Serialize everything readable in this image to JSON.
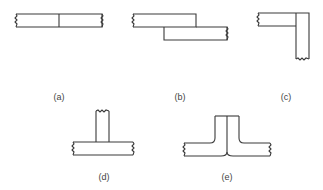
{
  "figure": {
    "panels": [
      {
        "id": "a",
        "label": "(a)",
        "description": "butt joint: two plates end to end"
      },
      {
        "id": "b",
        "label": "(b)",
        "description": "lap joint: two overlapping plates"
      },
      {
        "id": "c",
        "label": "(c)",
        "description": "corner joint: plates meeting at right angle"
      },
      {
        "id": "d",
        "label": "(d)",
        "description": "tee joint: vertical plate on horizontal plate"
      },
      {
        "id": "e",
        "label": "(e)",
        "description": "edge/flange joint: two bent plates joined back to back"
      }
    ],
    "colors": {
      "line": "#3a3a3a",
      "background": "#ffffff",
      "text": "#444444"
    }
  }
}
